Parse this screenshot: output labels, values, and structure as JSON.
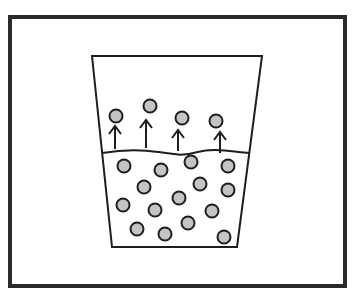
{
  "diagram": {
    "colors": {
      "frame": "#2a2a2a",
      "stroke": "#1e1e1e",
      "particle_fill": "#c4c4c4",
      "background": "#ffffff"
    },
    "container": {
      "shape": "trapezoid-beaker",
      "top_left": [
        92,
        56
      ],
      "top_right": [
        262,
        56
      ],
      "bottom_left": [
        112,
        247
      ],
      "bottom_right": [
        237,
        247
      ],
      "liquid_surface_y": 153
    },
    "escaping_particles": [
      {
        "x": 116,
        "y": 116,
        "arrow": {
          "x": 115,
          "y_top": 126,
          "y_bottom": 149
        }
      },
      {
        "x": 150,
        "y": 106,
        "arrow": {
          "x": 146,
          "y_top": 120,
          "y_bottom": 148
        }
      },
      {
        "x": 182,
        "y": 118,
        "arrow": {
          "x": 178,
          "y_top": 130,
          "y_bottom": 151
        }
      },
      {
        "x": 216,
        "y": 121,
        "arrow": {
          "x": 220,
          "y_top": 132,
          "y_bottom": 153
        }
      }
    ],
    "liquid_particles": [
      {
        "x": 124,
        "y": 166
      },
      {
        "x": 161,
        "y": 170
      },
      {
        "x": 191,
        "y": 162
      },
      {
        "x": 228,
        "y": 166
      },
      {
        "x": 144,
        "y": 187
      },
      {
        "x": 200,
        "y": 184
      },
      {
        "x": 228,
        "y": 190
      },
      {
        "x": 123,
        "y": 205
      },
      {
        "x": 155,
        "y": 210
      },
      {
        "x": 179,
        "y": 198
      },
      {
        "x": 212,
        "y": 211
      },
      {
        "x": 137,
        "y": 229
      },
      {
        "x": 165,
        "y": 234
      },
      {
        "x": 188,
        "y": 223
      },
      {
        "x": 224,
        "y": 237
      }
    ],
    "particle_radius": 6.5
  }
}
